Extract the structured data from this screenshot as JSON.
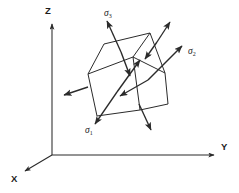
{
  "figure": {
    "background_color": "#ffffff",
    "stroke_color": "#2b2b2b",
    "width": 239,
    "height": 193
  },
  "axes": {
    "origin": {
      "x": 52,
      "y": 155
    },
    "items": [
      {
        "id": "z",
        "label": "Z",
        "label_x": 45,
        "label_y": 14,
        "from_x": 52,
        "from_y": 155,
        "to_x": 52,
        "to_y": 22,
        "direction": "up"
      },
      {
        "id": "y",
        "label": "Y",
        "label_x": 221,
        "label_y": 150,
        "from_x": 52,
        "from_y": 155,
        "to_x": 216,
        "to_y": 155,
        "direction": "right"
      },
      {
        "id": "x",
        "label": "X",
        "label_x": 11,
        "label_y": 182,
        "from_x": 52,
        "from_y": 155,
        "to_x": 23,
        "to_y": 172,
        "direction": "down-left"
      }
    ]
  },
  "cube": {
    "description": "oblique parallelepiped element",
    "vertices": {
      "front_left": {
        "x": 88,
        "y": 74
      },
      "front_top": {
        "x": 133,
        "y": 57
      },
      "front_right": {
        "x": 140,
        "y": 110
      },
      "front_bottom": {
        "x": 97,
        "y": 116
      },
      "back_top_right": {
        "x": 150,
        "y": 33
      },
      "right_far": {
        "x": 165,
        "y": 73
      },
      "back_left_top": {
        "x": 104,
        "y": 48
      },
      "hidden_back": {
        "x": 112,
        "y": 90
      }
    },
    "faces": [
      "front",
      "right",
      "top"
    ]
  },
  "stresses": [
    {
      "id": "sigma1",
      "symbol": "σ",
      "subscript": "1",
      "label_x": 85,
      "label_y": 133,
      "arrows": [
        {
          "from_x": 117,
          "from_y": 92,
          "to_x": 95,
          "to_y": 124
        },
        {
          "from_x": 117,
          "from_y": 92,
          "to_x": 140,
          "to_y": 60
        }
      ],
      "axis": "out of front-left face"
    },
    {
      "id": "sigma2",
      "symbol": "σ",
      "subscript": "2",
      "label_x": 188,
      "label_y": 54,
      "arrows": [
        {
          "from_x": 148,
          "from_y": 80,
          "to_x": 182,
          "to_y": 46
        },
        {
          "from_x": 148,
          "from_y": 80,
          "to_x": 119,
          "to_y": 96
        }
      ],
      "axis": "out of right face"
    },
    {
      "id": "sigma3",
      "symbol": "σ",
      "subscript": "3",
      "label_x": 105,
      "label_y": 16,
      "arrows": [
        {
          "from_x": 121,
          "from_y": 52,
          "to_x": 107,
          "to_y": 20
        },
        {
          "from_x": 121,
          "from_y": 52,
          "to_x": 130,
          "to_y": 75
        }
      ],
      "axis": "out of top face"
    },
    {
      "id": "sigma3-pair-right",
      "symbol": "",
      "subscript": "",
      "label_x": 0,
      "label_y": 0,
      "arrows": [
        {
          "from_x": 157,
          "from_y": 42,
          "to_x": 170,
          "to_y": 21
        },
        {
          "from_x": 157,
          "from_y": 42,
          "to_x": 145,
          "to_y": 58
        }
      ],
      "axis": "top face far corner"
    },
    {
      "id": "sigma1-pair-left",
      "symbol": "",
      "subscript": "",
      "label_x": 0,
      "label_y": 0,
      "arrows": [
        {
          "from_x": 88,
          "from_y": 87,
          "to_x": 63,
          "to_y": 95
        }
      ],
      "axis": "front-left face outward"
    },
    {
      "id": "sigma3-pair-down",
      "symbol": "",
      "subscript": "",
      "label_x": 0,
      "label_y": 0,
      "arrows": [
        {
          "from_x": 139,
          "from_y": 105,
          "to_x": 151,
          "to_y": 130
        }
      ],
      "axis": "bottom face outward"
    }
  ]
}
